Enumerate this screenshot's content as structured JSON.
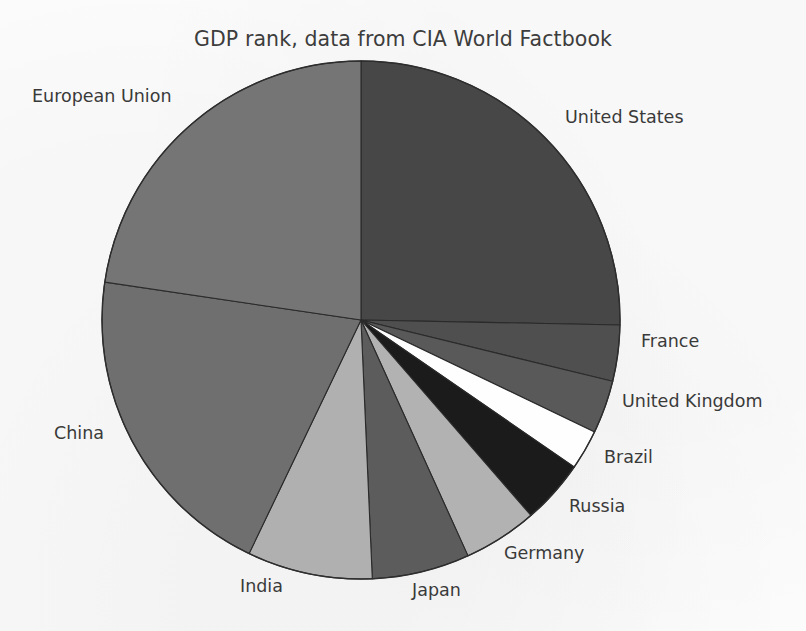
{
  "chart_data": {
    "type": "pie",
    "title": "GDP rank, data from CIA World Factbook",
    "xlabel": "",
    "ylabel": "",
    "grid": false,
    "legend": "none",
    "labels_position": "outside",
    "start_angle_deg": 90,
    "direction": "clockwise",
    "categories": [
      "United States",
      "France",
      "United Kingdom",
      "Brazil",
      "Russia",
      "Germany",
      "Japan",
      "India",
      "China",
      "European Union"
    ],
    "values": [
      25.3,
      3.5,
      3.3,
      2.5,
      4.0,
      4.6,
      6.1,
      7.8,
      20.2,
      22.7
    ],
    "units": "percent of total",
    "colors": [
      "#474747",
      "#4f4f4f",
      "#595959",
      "#fefefe",
      "#1b1b1b",
      "#b2b2b2",
      "#5c5c5c",
      "#b0b0b0",
      "#6f6f6f",
      "#757575"
    ]
  },
  "slices": [
    {
      "name": "United States",
      "label": "United States",
      "value": 25.3,
      "color": "#474747",
      "start_deg": 0.0,
      "end_deg": 91.1,
      "label_x": 565,
      "label_y": 109
    },
    {
      "name": "France",
      "label": "France",
      "value": 3.5,
      "color": "#4f4f4f",
      "start_deg": 91.1,
      "end_deg": 103.7,
      "label_x": 641,
      "label_y": 333
    },
    {
      "name": "United Kingdom",
      "label": "United Kingdom",
      "value": 3.3,
      "color": "#595959",
      "start_deg": 103.7,
      "end_deg": 115.6,
      "label_x": 622,
      "label_y": 393
    },
    {
      "name": "Brazil",
      "label": "Brazil",
      "value": 2.5,
      "color": "#fefefe",
      "start_deg": 115.6,
      "end_deg": 124.6,
      "label_x": 604,
      "label_y": 449
    },
    {
      "name": "Russia",
      "label": "Russia",
      "value": 4.0,
      "color": "#1b1b1b",
      "start_deg": 124.6,
      "end_deg": 139.0,
      "label_x": 569,
      "label_y": 498
    },
    {
      "name": "Germany",
      "label": "Germany",
      "value": 4.6,
      "color": "#b2b2b2",
      "start_deg": 139.0,
      "end_deg": 155.6,
      "label_x": 504,
      "label_y": 545
    },
    {
      "name": "Japan",
      "label": "Japan",
      "value": 6.1,
      "color": "#5c5c5c",
      "start_deg": 155.6,
      "end_deg": 177.5,
      "label_x": 412,
      "label_y": 582
    },
    {
      "name": "India",
      "label": "India",
      "value": 7.8,
      "color": "#b0b0b0",
      "start_deg": 177.5,
      "end_deg": 205.6,
      "label_x": 240,
      "label_y": 578
    },
    {
      "name": "China",
      "label": "China",
      "value": 20.2,
      "color": "#6f6f6f",
      "start_deg": 205.6,
      "end_deg": 278.4,
      "label_x": 54,
      "label_y": 425
    },
    {
      "name": "European Union",
      "label": "European Union",
      "value": 22.7,
      "color": "#757575",
      "start_deg": 278.4,
      "end_deg": 360.0,
      "label_x": 32,
      "label_y": 88
    }
  ],
  "geometry": {
    "center_x": 361,
    "center_y": 320,
    "radius": 259
  }
}
